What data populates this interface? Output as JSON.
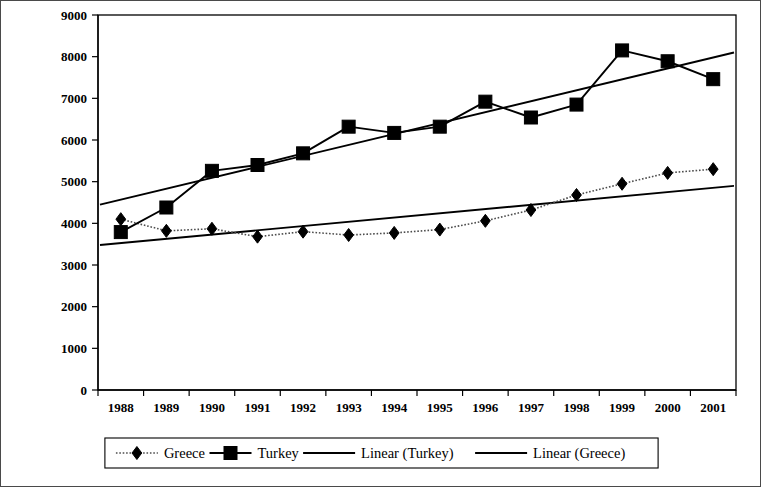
{
  "chart_data": {
    "type": "line",
    "title": "",
    "subtitle": "",
    "xlabel": "",
    "ylabel": "",
    "categories": [
      "1988",
      "1989",
      "1990",
      "1991",
      "1992",
      "1993",
      "1994",
      "1995",
      "1996",
      "1997",
      "1998",
      "1999",
      "2000",
      "2001"
    ],
    "ylim": [
      0,
      9000
    ],
    "ytick_step": 1000,
    "yticks": [
      "0",
      "1000",
      "2000",
      "3000",
      "4000",
      "5000",
      "6000",
      "7000",
      "8000",
      "9000"
    ],
    "grid": false,
    "legend_position": "bottom",
    "series": [
      {
        "name": "Greece",
        "marker": "diamond",
        "linestyle": "dotted",
        "color": "#000000",
        "values": [
          4100,
          3820,
          3870,
          3680,
          3800,
          3720,
          3770,
          3850,
          4060,
          4320,
          4680,
          4950,
          5210,
          5300
        ]
      },
      {
        "name": "Turkey",
        "marker": "square",
        "linestyle": "solid",
        "color": "#000000",
        "values": [
          3790,
          4380,
          5260,
          5400,
          5680,
          6320,
          6170,
          6320,
          6920,
          6540,
          6850,
          8150,
          7890,
          7460
        ]
      },
      {
        "name": "Linear (Turkey)",
        "marker": "none",
        "linestyle": "solid",
        "color": "#000000",
        "trend": true,
        "endpoints": [
          4450,
          8100
        ]
      },
      {
        "name": "Linear (Greece)",
        "marker": "none",
        "linestyle": "solid",
        "color": "#000000",
        "trend": true,
        "endpoints": [
          3480,
          4900
        ]
      }
    ]
  },
  "legend": {
    "items": [
      {
        "label": "Greece",
        "marker": "diamond",
        "linestyle": "dotted"
      },
      {
        "label": "Turkey",
        "marker": "square",
        "linestyle": "solid"
      },
      {
        "label": "Linear (Turkey)",
        "marker": "none",
        "linestyle": "solid"
      },
      {
        "label": "Linear (Greece)",
        "marker": "none",
        "linestyle": "solid"
      }
    ]
  }
}
